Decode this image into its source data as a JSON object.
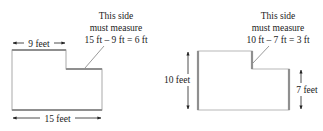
{
  "colors": {
    "outline": "#b8b8b8",
    "highlight": "#8f8f8f",
    "text": "#222222",
    "arrow": "#222222"
  },
  "left_figure": {
    "top_dimension_label": "9 feet",
    "bottom_dimension_label": "15 feet",
    "callout": {
      "line1": "This side",
      "line2": "must measure",
      "line3": "15 ft – 9 ft = 6 ft"
    }
  },
  "right_figure": {
    "left_dimension_label": "10 feet",
    "right_dimension_label": "7 feet",
    "callout": {
      "line1": "This side",
      "line2": "must measure",
      "line3": "10 ft – 7 ft = 3 ft"
    }
  }
}
